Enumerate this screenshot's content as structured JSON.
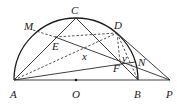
{
  "diagram": {
    "type": "geometry",
    "points": {
      "A": {
        "label": "A",
        "x": 14,
        "y": 80
      },
      "O": {
        "label": "O",
        "x": 76,
        "y": 80
      },
      "B": {
        "label": "B",
        "x": 138,
        "y": 80
      },
      "P": {
        "label": "P",
        "x": 170,
        "y": 80
      },
      "C": {
        "label": "C",
        "x": 76,
        "y": 18
      },
      "M": {
        "label": "M",
        "x": 33,
        "y": 30
      },
      "D": {
        "label": "D",
        "x": 117,
        "y": 33
      },
      "E": {
        "label": "E",
        "x": 55,
        "y": 37
      },
      "F": {
        "label": "F",
        "x": 120,
        "y": 62
      },
      "N": {
        "label": "N",
        "x": 135,
        "y": 62
      }
    },
    "angle_labels": {
      "x": {
        "label": "x"
      },
      "y": {
        "label": "y"
      }
    }
  }
}
